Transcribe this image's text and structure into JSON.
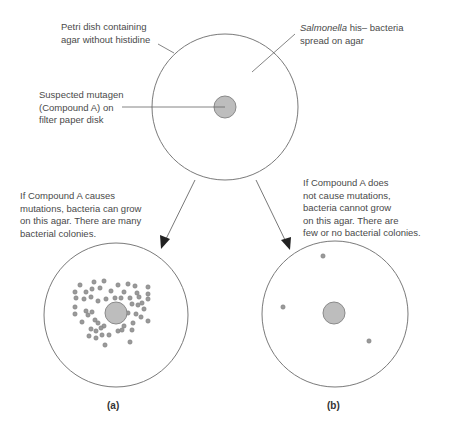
{
  "labels": {
    "petri_dish_line1": "Petri dish containing",
    "petri_dish_line2": "agar without histidine",
    "salmonella_italic": "Salmonella",
    "salmonella_rest": " his– bacteria",
    "salmonella_line2": "spread on agar",
    "mutagen_line1": "Suspected mutagen",
    "mutagen_line2": "(Compound A) on",
    "mutagen_line3": "filter paper disk",
    "case_a_line1": "If Compound A causes",
    "case_a_line2": "mutations, bacteria can grow",
    "case_a_line3": "on this agar. There are many",
    "case_a_line4": "bacterial colonies.",
    "case_b_line1": "If Compound A does",
    "case_b_line2": "not cause mutations,",
    "case_b_line3": "bacteria cannot grow",
    "case_b_line4": "on this agar. There are",
    "case_b_line5": "few or no bacterial colonies.",
    "caption_a": "(a)",
    "caption_b": "(b)"
  },
  "colors": {
    "dish_outline": "#7a7a7a",
    "disk_fill": "#bdbdbd",
    "disk_stroke": "#8a8a8a",
    "colony_fill": "#9a9a9a",
    "text": "#4a4a4a"
  }
}
